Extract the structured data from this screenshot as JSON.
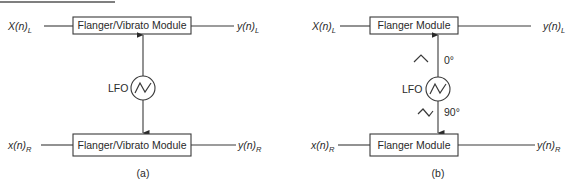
{
  "figure": {
    "top_rule": true,
    "panels": [
      {
        "id": "a",
        "caption": "(a)",
        "top_module": {
          "label": "Flanger/Vibrato Module",
          "input": {
            "base": "X(n)",
            "sub": "L"
          },
          "output": {
            "base": "y(n)",
            "sub": "L"
          }
        },
        "bottom_module": {
          "label": "Flanger/Vibrato Module",
          "input": {
            "base": "x(n)",
            "sub": "R"
          },
          "output": {
            "base": "y(n)",
            "sub": "R"
          }
        },
        "lfo": {
          "label": "LFO",
          "icon": "triangle-wave-icon"
        },
        "connections": [
          "LFO -> top module",
          "LFO -> bottom module"
        ]
      },
      {
        "id": "b",
        "caption": "(b)",
        "top_module": {
          "label": "Flanger Module",
          "input": {
            "base": "X(n)",
            "sub": "L"
          },
          "output": {
            "base": "y(n)",
            "sub": "L"
          }
        },
        "bottom_module": {
          "label": "Flanger Module",
          "input": {
            "base": "x(n)",
            "sub": "R"
          },
          "output": {
            "base": "y(n)",
            "sub": "R"
          }
        },
        "lfo": {
          "label": "LFO",
          "icon": "triangle-wave-icon"
        },
        "phase_top": "0°",
        "phase_bottom": "90°",
        "connections": [
          "LFO -> top module (0° phase)",
          "LFO -> bottom module (90° phase)"
        ]
      }
    ]
  }
}
